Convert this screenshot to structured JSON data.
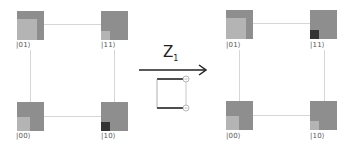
{
  "colors": {
    "node_base": "#8e8e8e",
    "light_fill": "#b4b4b4",
    "dark_fill": "#333333",
    "edge": "#d6d6d6",
    "arrow": "#222222"
  },
  "operation": {
    "label": "Z",
    "subscript": "1"
  },
  "before": {
    "nodes": [
      {
        "state": "|01⟩",
        "fill": "light",
        "fill_w": 20,
        "fill_h": 23
      },
      {
        "state": "|11⟩",
        "fill": "light",
        "fill_w": 9,
        "fill_h": 9
      },
      {
        "state": "|00⟩",
        "fill": "light",
        "fill_w": 13,
        "fill_h": 14
      },
      {
        "state": "|10⟩",
        "fill": "dark",
        "fill_w": 9,
        "fill_h": 9
      }
    ]
  },
  "after": {
    "nodes": [
      {
        "state": "|01⟩",
        "fill": "light",
        "fill_w": 20,
        "fill_h": 23
      },
      {
        "state": "|11⟩",
        "fill": "dark",
        "fill_w": 9,
        "fill_h": 9
      },
      {
        "state": "|00⟩",
        "fill": "light",
        "fill_w": 13,
        "fill_h": 14
      },
      {
        "state": "|10⟩",
        "fill": "light",
        "fill_w": 9,
        "fill_h": 9
      }
    ]
  }
}
